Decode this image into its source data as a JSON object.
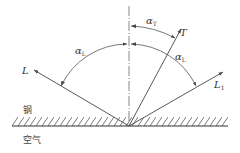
{
  "diagram": {
    "type": "ultrasonic-wave-reflection",
    "media": {
      "upper": "钢",
      "lower": "空气"
    },
    "rays": {
      "incident": {
        "label": "L",
        "sub": ""
      },
      "reflected_longitudinal": {
        "label": "L",
        "sub": "1"
      },
      "reflected_transverse": {
        "label": "T",
        "sub": ""
      }
    },
    "angles": {
      "incident": {
        "label": "α",
        "sub": "L"
      },
      "reflected_longitudinal": {
        "label": "α",
        "sub": "L"
      },
      "reflected_transverse": {
        "label": "α",
        "sub": "T"
      }
    },
    "colors": {
      "line": "#444444",
      "background": "#ffffff"
    }
  }
}
